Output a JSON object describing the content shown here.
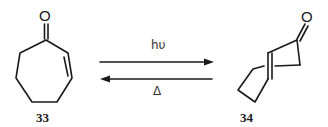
{
  "diagram": {
    "type": "reaction-scheme",
    "reactant": {
      "id_label": "33",
      "atom_label": "O",
      "description": "2-cycloheptenone (cis)"
    },
    "product": {
      "id_label": "34",
      "atom_label": "O",
      "description": "trans-2-cycloheptenone"
    },
    "forward_condition": "hυ",
    "reverse_condition": "Δ",
    "colors": {
      "ink": "#1a1a1a",
      "background": "#ffffff"
    }
  }
}
